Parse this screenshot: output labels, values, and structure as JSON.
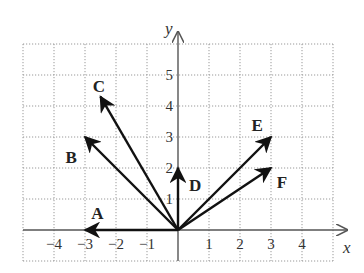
{
  "diagram": {
    "title": "",
    "axes": {
      "x_label": "x",
      "y_label": "y",
      "x_ticks": [
        "−4",
        "−3",
        "−2",
        "−1",
        "1",
        "2",
        "3",
        "4"
      ],
      "x_tick_values": [
        -4,
        -3,
        -2,
        -1,
        1,
        2,
        3,
        4
      ],
      "y_ticks": [
        "1",
        "2",
        "3",
        "4",
        "5"
      ],
      "y_tick_values": [
        1,
        2,
        3,
        4,
        5
      ],
      "grid": {
        "x_range": [
          -5,
          5
        ],
        "y_range": [
          -1,
          6
        ],
        "style": "dotted",
        "color": "#999999"
      }
    },
    "vectors": [
      {
        "label": "A",
        "x": -3,
        "y": 0
      },
      {
        "label": "B",
        "x": -3,
        "y": 3
      },
      {
        "label": "C",
        "x": -2.5,
        "y": 4.3
      },
      {
        "label": "D",
        "x": 0,
        "y": 2
      },
      {
        "label": "E",
        "x": 3,
        "y": 3
      },
      {
        "label": "F",
        "x": 3,
        "y": 2
      }
    ],
    "colors": {
      "vector": "#111111",
      "axis": "#555555",
      "grid": "#999999"
    }
  }
}
